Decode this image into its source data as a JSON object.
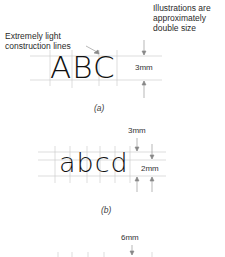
{
  "figure": {
    "note": "Illustrations are approximately double size",
    "note_lines": [
      "Illustrations are",
      "approximately",
      "double size"
    ],
    "callout": "Extremely light construction lines",
    "callout_lines": [
      "Extremely light",
      "construction lines"
    ],
    "panel_a": {
      "letters": "ABC",
      "dimension": "3mm",
      "caption": "(a)",
      "caption_letter": "a"
    },
    "panel_b": {
      "letters": "abcd",
      "dimension_top": "3mm",
      "dimension_side": "2mm",
      "caption": "(b)",
      "caption_letter": "b"
    },
    "panel_c": {
      "dimension_top": "6mm"
    }
  }
}
